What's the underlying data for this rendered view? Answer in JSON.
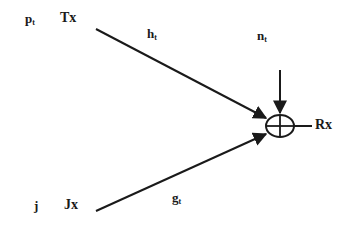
{
  "diagram": {
    "type": "signal-flow",
    "colors": {
      "background": "#ffffff",
      "stroke": "#1a1a1a"
    },
    "nodes": {
      "transmitter": {
        "label": "Tx",
        "power_symbol": "p",
        "power_sub": "t"
      },
      "jammer": {
        "label": "Jx",
        "power_symbol": "j",
        "power_sub": ""
      },
      "receiver": {
        "label": "Rx"
      },
      "summer": {
        "symbol": "⊕"
      }
    },
    "edges": {
      "tx_to_rx": {
        "symbol": "h",
        "sub": "t"
      },
      "jx_to_rx": {
        "symbol": "g",
        "sub": "t"
      },
      "noise": {
        "symbol": "n",
        "sub": "t"
      }
    }
  }
}
